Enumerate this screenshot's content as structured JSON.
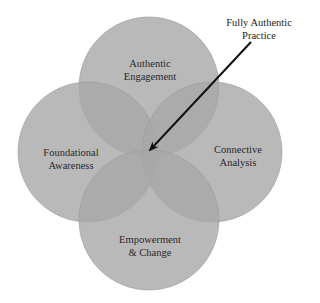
{
  "diagram": {
    "type": "four-circle-venn",
    "colors": {
      "circle_fill": "#a3a3a3",
      "circle_opacity": 0.78,
      "background": "#ffffff",
      "text": "#2a2a2a",
      "arrow": "#111111"
    },
    "circles": [
      {
        "id": "top",
        "line1": "Authentic",
        "line2": "Engagement"
      },
      {
        "id": "left",
        "line1": "Foundational",
        "line2": "Awareness"
      },
      {
        "id": "right",
        "line1": "Connective",
        "line2": "Analysis"
      },
      {
        "id": "bottom",
        "line1": "Empowerment",
        "line2": "& Change"
      }
    ],
    "callout": {
      "line1": "Fully Authentic",
      "line2": "Practice",
      "points_to": "center intersection of all four circles"
    }
  }
}
